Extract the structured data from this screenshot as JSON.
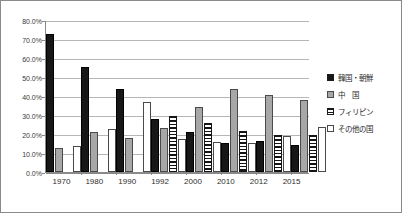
{
  "chart_data": {
    "type": "bar",
    "title": "",
    "subtitle": "",
    "xlabel": "",
    "ylabel": "",
    "ylim": [
      0,
      80
    ],
    "ytick_labels": [
      "80.0%",
      "70.0%",
      "60.0%",
      "50.0%",
      "40.0%",
      "30.0%",
      "20.0%",
      "10.0%",
      "0.0%"
    ],
    "ytick_values": [
      80,
      70,
      60,
      50,
      40,
      30,
      20,
      10,
      0
    ],
    "grid": true,
    "legend_position": "right",
    "categories": [
      "1970",
      "1980",
      "1990",
      "1992",
      "2000",
      "2010",
      "2012",
      "2015"
    ],
    "series": [
      {
        "name": "韓国・朝鮮",
        "swatch": "s0",
        "values": [
          72.5,
          55.3,
          43.6,
          27.9,
          21.2,
          15.1,
          16.4,
          14.0
        ]
      },
      {
        "name": "中　国",
        "swatch": "s1",
        "values": [
          12.9,
          20.8,
          18.0,
          23.1,
          34.2,
          43.6,
          40.6,
          37.7
        ]
      },
      {
        "name": "フィリピン",
        "swatch": "s2",
        "values": [
          null,
          null,
          null,
          29.6,
          25.9,
          21.8,
          19.3,
          19.5
        ]
      },
      {
        "name": "その他の国",
        "swatch": "s3",
        "values": [
          13.9,
          22.9,
          36.9,
          17.3,
          15.6,
          15.4,
          19.0,
          23.9
        ]
      }
    ]
  },
  "legend": {
    "items": [
      {
        "label": "韓国・朝鮮",
        "swatch": "s0"
      },
      {
        "label": "中　国",
        "swatch": "s1"
      },
      {
        "label": "フィリピン",
        "swatch": "s2"
      },
      {
        "label": "その他の国",
        "swatch": "s3"
      }
    ]
  }
}
